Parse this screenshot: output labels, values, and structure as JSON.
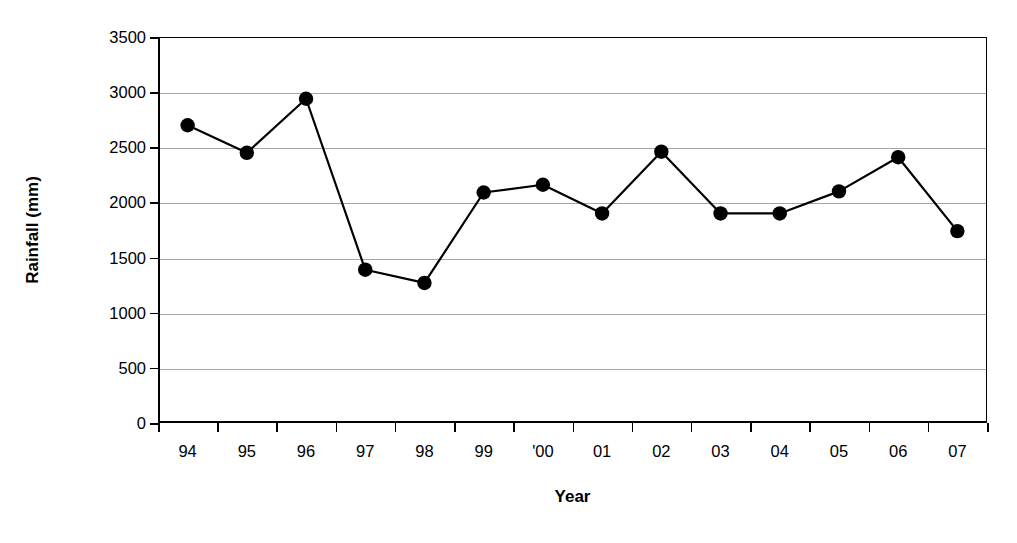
{
  "chart_data": {
    "type": "line",
    "title": "",
    "xlabel": "Year",
    "ylabel": "Rainfall (mm)",
    "categories": [
      "94",
      "95",
      "96",
      "97",
      "98",
      "99",
      "'00",
      "01",
      "02",
      "03",
      "04",
      "05",
      "06",
      "07"
    ],
    "values": [
      2700,
      2450,
      2940,
      1390,
      1270,
      2090,
      2160,
      1900,
      2460,
      1900,
      1900,
      2100,
      2410,
      1740
    ],
    "series": [
      {
        "name": "Rainfall",
        "values": [
          2700,
          2450,
          2940,
          1390,
          1270,
          2090,
          2160,
          1900,
          2460,
          1900,
          1900,
          2100,
          2410,
          1740
        ]
      }
    ],
    "ylim": [
      0,
      3500
    ],
    "yticks": [
      0,
      500,
      1000,
      1500,
      2000,
      2500,
      3000,
      3500
    ],
    "ytick_labels": [
      "0",
      "500",
      "1000",
      "1500",
      "2000",
      "2500",
      "3000",
      "3500"
    ],
    "grid": "horizontal",
    "legend": "none",
    "marker": "filled-circle",
    "line_color": "#000000",
    "marker_color": "#000000",
    "grid_color": "#a6a6a6",
    "axis_color": "#000000",
    "background_color": "#ffffff"
  }
}
